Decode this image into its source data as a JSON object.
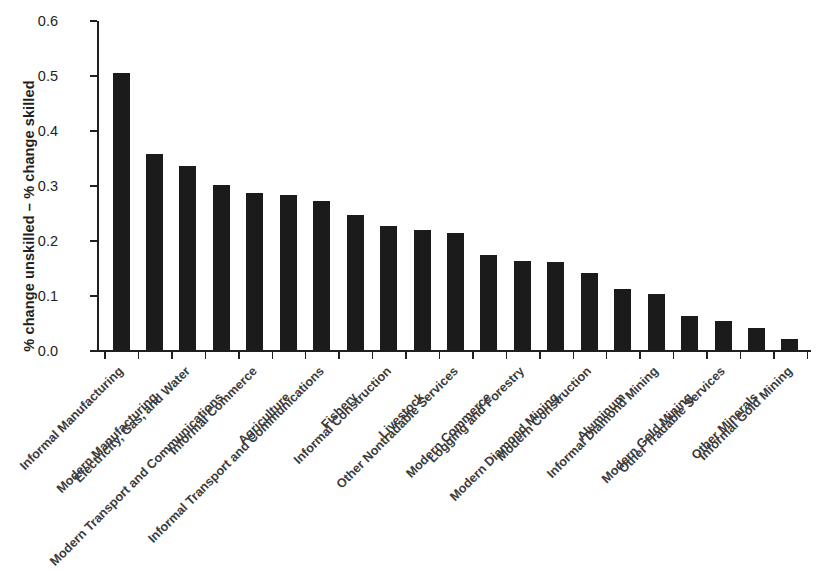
{
  "chart_data": {
    "type": "bar",
    "title": "",
    "subtitle": "",
    "xlabel": "",
    "ylabel": "% change unskilled – % change skilled",
    "ylim": [
      0.0,
      0.6
    ],
    "yticks": [
      "0.0",
      "0.1",
      "0.2",
      "0.3",
      "0.4",
      "0.5",
      "0.6"
    ],
    "ytick_values": [
      0.0,
      0.1,
      0.2,
      0.3,
      0.4,
      0.5,
      0.6
    ],
    "grid": false,
    "legend": null,
    "bar_color": "#1b1b1b",
    "categories": [
      "Informal Manufacturing",
      "Modern Manufacturing",
      "Electricity, Gas, and Water",
      "Modern Transport and Communications",
      "Informal Commerce",
      "Agriculture",
      "Informal Transport and Communications",
      "Fishery",
      "Informal Construction",
      "Livestock",
      "Other Nontradable Services",
      "Modern Commerce",
      "Logging and Forestry",
      "Modern Diamond Mining",
      "Modern Construction",
      "Aluminum",
      "Informal Diamond Mining",
      "Modern Gold Mining",
      "Other Tradable Services",
      "Other Minerals",
      "Informal Gold Mining"
    ],
    "values": [
      0.506,
      0.359,
      0.336,
      0.301,
      0.287,
      0.284,
      0.272,
      0.248,
      0.228,
      0.22,
      0.214,
      0.175,
      0.164,
      0.162,
      0.142,
      0.113,
      0.103,
      0.064,
      0.055,
      0.041,
      0.022
    ]
  }
}
